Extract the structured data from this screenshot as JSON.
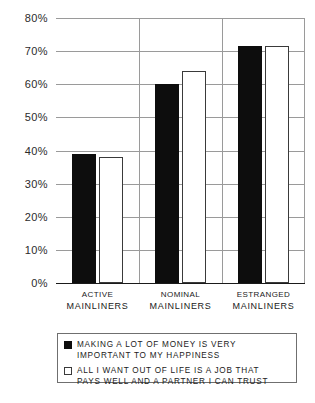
{
  "chart_data": {
    "type": "bar",
    "title": "",
    "subtitle": "",
    "xlabel": "",
    "ylabel": "",
    "ylim": [
      0,
      80
    ],
    "ytick_labels": [
      "80%",
      "70%",
      "60%",
      "50%",
      "40%",
      "30%",
      "20%",
      "10%",
      "0%"
    ],
    "ytick_values": [
      80,
      70,
      60,
      50,
      40,
      30,
      20,
      10,
      0
    ],
    "grid": true,
    "legend_position": "below-plot",
    "categories": [
      "Active Mainliners",
      "Nominal Mainliners",
      "Estranged Mainliners"
    ],
    "category_lines": [
      {
        "line1": "Active",
        "line2": "Mainliners"
      },
      {
        "line1": "Nominal",
        "line2": "Mainliners"
      },
      {
        "line1": "Estranged",
        "line2": "Mainliners"
      }
    ],
    "series": [
      {
        "name": "Making a lot of money is very important to my happiness",
        "color": "#0d0d0d",
        "style": "filled-black",
        "values": [
          39,
          60,
          71.5
        ]
      },
      {
        "name": "All I want out of life is a job that pays well and a partner I can trust",
        "color": "#ffffff",
        "style": "outlined-white",
        "values": [
          38,
          64,
          71.5
        ]
      }
    ]
  },
  "legend": {
    "entries": [
      {
        "swatch": "black",
        "text": "Making a lot of money is very\nimportant to my happiness"
      },
      {
        "swatch": "white",
        "text": "All I want out of life is a job that\npays well and a partner I can trust"
      }
    ]
  },
  "axis": {
    "ticks": [
      {
        "label": "80%",
        "value": 80
      },
      {
        "label": "70%",
        "value": 70
      },
      {
        "label": "60%",
        "value": 60
      },
      {
        "label": "50%",
        "value": 50
      },
      {
        "label": "40%",
        "value": 40
      },
      {
        "label": "30%",
        "value": 30
      },
      {
        "label": "20%",
        "value": 20
      },
      {
        "label": "10%",
        "value": 10
      },
      {
        "label": "0%",
        "value": 0
      }
    ]
  }
}
